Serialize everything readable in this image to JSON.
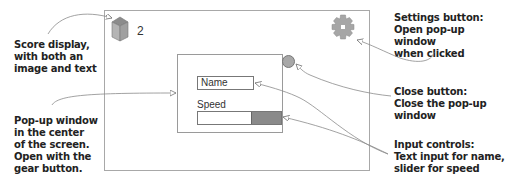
{
  "diagram": {
    "screen": {
      "score": {
        "icon": "cube-icon",
        "value": "2"
      },
      "settings_button": {
        "icon": "gear-icon"
      },
      "popup": {
        "name_input": {
          "value": "Name"
        },
        "speed_label": "Speed",
        "speed_slider": {
          "fill_percent": 35
        },
        "close_button": {
          "icon": "circle-icon"
        }
      }
    },
    "callouts": {
      "score": "Score display,\nwith both an\nimage and text",
      "popup": "Pop-up window\nin the center\nof the screen.\nOpen with the\ngear button.",
      "settings": "Settings button:\nOpen pop-up window\nwhen clicked",
      "close": "Close button:\nClose the pop-up\nwindow",
      "inputs": "Input controls:\nText input for name,\nslider for speed"
    },
    "colors": {
      "frame": "#a8a8a8",
      "icon_fill": "#a0a0a0",
      "slider_fill": "#8a8a8a",
      "text": "#222222"
    }
  }
}
